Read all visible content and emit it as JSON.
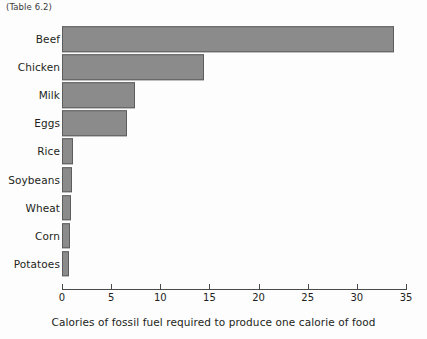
{
  "caption": "(Table 6.2)",
  "chart_data": {
    "type": "bar",
    "orientation": "horizontal",
    "title": "",
    "xlabel": "Calories of fossil fuel required to produce one calorie of food",
    "ylabel": "",
    "categories": [
      "Beef",
      "Chicken",
      "Milk",
      "Eggs",
      "Rice",
      "Soybeans",
      "Wheat",
      "Corn",
      "Potatoes"
    ],
    "values": [
      33.8,
      14.4,
      7.4,
      6.6,
      1.1,
      1.0,
      0.9,
      0.8,
      0.7
    ],
    "xlim": [
      0,
      35
    ],
    "xticks": [
      0,
      5,
      10,
      15,
      20,
      25,
      30,
      35
    ],
    "xtick_labels": [
      "0",
      "5",
      "10",
      "15",
      "20",
      "25",
      "30",
      "35"
    ],
    "grid": false,
    "legend": null,
    "bar_color": "#8b8b8b",
    "bar_edge_color": "#5d5d5d",
    "background_color": "#fdfdfd",
    "axis_color": "#4a4a4a",
    "text_color": "#231f20"
  }
}
